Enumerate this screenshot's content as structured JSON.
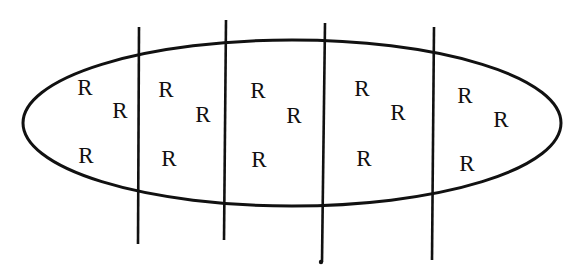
{
  "diagram": {
    "type": "ellipse-partitioned-by-vertical-lines",
    "ellipse": {
      "cx": 292,
      "cy": 123,
      "rx": 269,
      "ry": 83,
      "stroke": "#111111"
    },
    "dividers": [
      {
        "x1": 139,
        "y1": 27,
        "x2": 138,
        "y2": 244
      },
      {
        "x1": 226,
        "y1": 20,
        "x2": 224,
        "y2": 240
      },
      {
        "x1": 325,
        "y1": 23,
        "x2": 322,
        "y2": 262
      },
      {
        "x1": 434,
        "y1": 27,
        "x2": 432,
        "y2": 260
      }
    ],
    "end_dot": {
      "x": 321,
      "y": 262
    },
    "regions": [
      {
        "name": "region-1",
        "labels": [
          {
            "text": "R",
            "x": 85,
            "y": 87
          },
          {
            "text": "R",
            "x": 120,
            "y": 110
          },
          {
            "text": "R",
            "x": 86,
            "y": 155
          }
        ]
      },
      {
        "name": "region-2",
        "labels": [
          {
            "text": "R",
            "x": 166,
            "y": 89
          },
          {
            "text": "R",
            "x": 203,
            "y": 114
          },
          {
            "text": "R",
            "x": 169,
            "y": 158
          }
        ]
      },
      {
        "name": "region-3",
        "labels": [
          {
            "text": "R",
            "x": 258,
            "y": 90
          },
          {
            "text": "R",
            "x": 294,
            "y": 115
          },
          {
            "text": "R",
            "x": 259,
            "y": 159
          }
        ]
      },
      {
        "name": "region-4",
        "labels": [
          {
            "text": "R",
            "x": 362,
            "y": 88
          },
          {
            "text": "R",
            "x": 398,
            "y": 112
          },
          {
            "text": "R",
            "x": 364,
            "y": 158
          }
        ]
      },
      {
        "name": "region-5",
        "labels": [
          {
            "text": "R",
            "x": 465,
            "y": 95
          },
          {
            "text": "R",
            "x": 501,
            "y": 119
          },
          {
            "text": "R",
            "x": 467,
            "y": 163
          }
        ]
      }
    ]
  }
}
